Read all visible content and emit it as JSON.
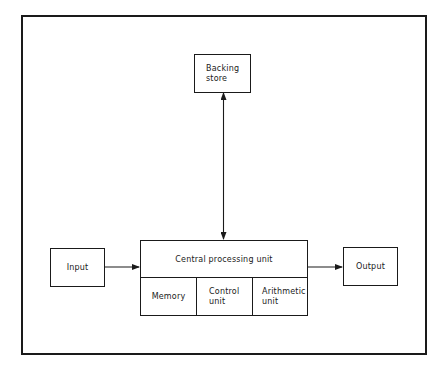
{
  "diagram": {
    "type": "block-diagram",
    "nodes": {
      "backing_store": {
        "label_line1": "Backing",
        "label_line2": "store"
      },
      "input": {
        "label": "Input"
      },
      "output": {
        "label": "Output"
      },
      "cpu": {
        "title": "Central processing unit",
        "components": [
          {
            "label_line1": "Memory",
            "label_line2": ""
          },
          {
            "label_line1": "Control",
            "label_line2": "unit"
          },
          {
            "label_line1": "Arithmetic",
            "label_line2": "unit"
          }
        ]
      }
    },
    "edges": [
      {
        "from": "backing_store",
        "to": "cpu",
        "direction": "bidirectional"
      },
      {
        "from": "input",
        "to": "cpu",
        "direction": "forward"
      },
      {
        "from": "cpu",
        "to": "output",
        "direction": "forward"
      }
    ],
    "colors": {
      "line": "#1a1a1a",
      "background": "#ffffff"
    }
  }
}
